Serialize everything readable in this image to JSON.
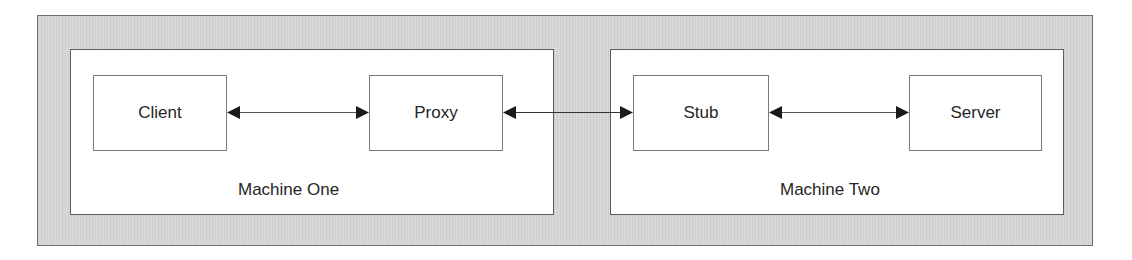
{
  "diagram": {
    "type": "architecture",
    "machines": [
      {
        "id": "machine-one",
        "label": "Machine One",
        "nodes": [
          "client",
          "proxy"
        ]
      },
      {
        "id": "machine-two",
        "label": "Machine Two",
        "nodes": [
          "stub",
          "server"
        ]
      }
    ],
    "nodes": {
      "client": {
        "label": "Client"
      },
      "proxy": {
        "label": "Proxy"
      },
      "stub": {
        "label": "Stub"
      },
      "server": {
        "label": "Server"
      }
    },
    "edges": [
      {
        "from": "client",
        "to": "proxy",
        "direction": "bidirectional"
      },
      {
        "from": "proxy",
        "to": "stub",
        "direction": "bidirectional"
      },
      {
        "from": "stub",
        "to": "server",
        "direction": "bidirectional"
      }
    ],
    "colors": {
      "background_frame": "#d4d4d4",
      "box_fill": "#ffffff",
      "box_border": "#7a7a7a",
      "arrow": "#1a1a1a",
      "text": "#262626"
    }
  }
}
